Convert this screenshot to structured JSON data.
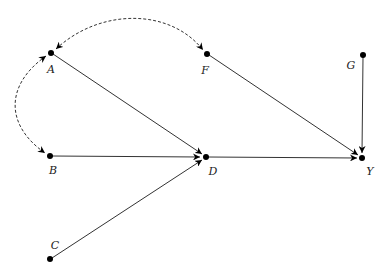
{
  "diagram": {
    "type": "causal-dag",
    "nodes": [
      {
        "id": "A",
        "label": "A",
        "x": 51,
        "y": 53
      },
      {
        "id": "F",
        "label": "F",
        "x": 207,
        "y": 54
      },
      {
        "id": "G",
        "label": "G",
        "x": 363,
        "y": 55
      },
      {
        "id": "B",
        "label": "B",
        "x": 50,
        "y": 156
      },
      {
        "id": "D",
        "label": "D",
        "x": 206,
        "y": 157
      },
      {
        "id": "Y",
        "label": "Y",
        "x": 362,
        "y": 158
      },
      {
        "id": "C",
        "label": "C",
        "x": 50,
        "y": 259
      }
    ],
    "edges": [
      {
        "from": "A",
        "to": "D",
        "style": "solid",
        "directed": true
      },
      {
        "from": "B",
        "to": "D",
        "style": "solid",
        "directed": true
      },
      {
        "from": "C",
        "to": "D",
        "style": "solid",
        "directed": true
      },
      {
        "from": "D",
        "to": "Y",
        "style": "solid",
        "directed": true
      },
      {
        "from": "F",
        "to": "Y",
        "style": "solid",
        "directed": true
      },
      {
        "from": "G",
        "to": "Y",
        "style": "solid",
        "directed": true
      },
      {
        "from": "A",
        "to": "F",
        "style": "dashed",
        "bidirected": true
      },
      {
        "from": "A",
        "to": "B",
        "style": "dashed",
        "bidirected": true
      }
    ]
  }
}
